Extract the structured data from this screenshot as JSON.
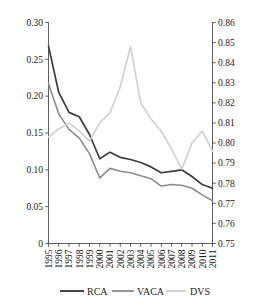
{
  "chart_data": {
    "type": "line",
    "title": "",
    "subtitle": "",
    "xlabel": "",
    "ylabel": "",
    "y2label": "",
    "grid": false,
    "legend_position": "bottom",
    "x": [
      1995,
      1996,
      1997,
      1998,
      1999,
      2000,
      2001,
      2002,
      2003,
      2004,
      2005,
      2006,
      2007,
      2008,
      2009,
      2010,
      2011
    ],
    "categories": [
      "1995",
      "1996",
      "1997",
      "1998",
      "1999",
      "2000",
      "2001",
      "2002",
      "2003",
      "2004",
      "2005",
      "2006",
      "2007",
      "2008",
      "2009",
      "2010",
      "2011"
    ],
    "left_axis": {
      "ylim": [
        0,
        0.3
      ],
      "ticks": [
        0,
        0.05,
        0.1,
        0.15,
        0.2,
        0.25,
        0.3
      ],
      "tick_labels": [
        "0",
        "0.05",
        "0.10",
        "0.15",
        "0.20",
        "0.25",
        "0.30"
      ]
    },
    "right_axis": {
      "ylim": [
        0.75,
        0.86
      ],
      "ticks": [
        0.75,
        0.76,
        0.77,
        0.78,
        0.79,
        0.8,
        0.81,
        0.82,
        0.83,
        0.84,
        0.85,
        0.86
      ],
      "tick_labels": [
        "0.75",
        "0.76",
        "0.77",
        "0.78",
        "0.79",
        "0.80",
        "0.81",
        "0.82",
        "0.83",
        "0.84",
        "0.85",
        "0.86"
      ]
    },
    "series": [
      {
        "name": "RCA",
        "axis": "left",
        "color": "#3c3c3c",
        "width": 1.7,
        "values": [
          0.268,
          0.205,
          0.178,
          0.172,
          0.148,
          0.115,
          0.124,
          0.117,
          0.114,
          0.11,
          0.104,
          0.096,
          0.098,
          0.1,
          0.091,
          0.08,
          0.075
        ]
      },
      {
        "name": "VACA",
        "axis": "left",
        "color": "#8c8c8c",
        "width": 1.6,
        "values": [
          0.217,
          0.176,
          0.155,
          0.143,
          0.122,
          0.089,
          0.102,
          0.098,
          0.096,
          0.092,
          0.088,
          0.078,
          0.08,
          0.079,
          0.075,
          0.066,
          0.058
        ]
      },
      {
        "name": "DVS",
        "axis": "right",
        "color": "#d2d2d2",
        "width": 1.7,
        "values": [
          0.803,
          0.807,
          0.81,
          0.806,
          0.801,
          0.81,
          0.815,
          0.828,
          0.848,
          0.82,
          0.812,
          0.806,
          0.797,
          0.787,
          0.8,
          0.806,
          0.796
        ]
      }
    ]
  },
  "legend": {
    "items": [
      {
        "label": "RCA",
        "color": "#3c3c3c"
      },
      {
        "label": "VACA",
        "color": "#8c8c8c"
      },
      {
        "label": "DVS",
        "color": "#d2d2d2"
      }
    ]
  }
}
